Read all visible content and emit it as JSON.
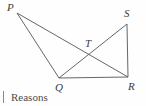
{
  "figure": {
    "type": "geometry-diagram",
    "background_color": "#fefefe",
    "stroke_color": "#555555",
    "label_color": "#3b3b3b",
    "points": {
      "P": {
        "label": "P",
        "x": 17,
        "y": 13,
        "label_x": 7,
        "label_y": 2
      },
      "S": {
        "label": "S",
        "x": 127,
        "y": 24,
        "label_x": 124,
        "label_y": 8
      },
      "T": {
        "label": "T",
        "x": 90,
        "y": 52,
        "label_x": 85,
        "label_y": 38
      },
      "Q": {
        "label": "Q",
        "x": 59,
        "y": 78,
        "label_x": 55,
        "label_y": 82
      },
      "R": {
        "label": "R",
        "x": 128,
        "y": 77,
        "label_x": 128,
        "label_y": 81
      }
    },
    "segments": [
      {
        "name": "segment-PQ",
        "from": "P",
        "to": "Q"
      },
      {
        "name": "segment-PR",
        "from": "P",
        "to": "R"
      },
      {
        "name": "segment-QR",
        "from": "Q",
        "to": "R"
      },
      {
        "name": "segment-QS",
        "from": "Q",
        "to": "S"
      },
      {
        "name": "segment-SR",
        "from": "S",
        "to": "R"
      }
    ]
  },
  "caption": {
    "text": "Reasons"
  }
}
